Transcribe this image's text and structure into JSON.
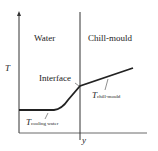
{
  "diagram": {
    "regions": {
      "left": "Water",
      "right": "Chill-mould"
    },
    "axes": {
      "y_label": "T",
      "x_label": "y"
    },
    "interface_label": "Interface",
    "curves": {
      "water": {
        "symbol": "T",
        "subscript": "cooling water"
      },
      "mould": {
        "symbol": "T",
        "subscript": "chill-mould"
      }
    }
  }
}
